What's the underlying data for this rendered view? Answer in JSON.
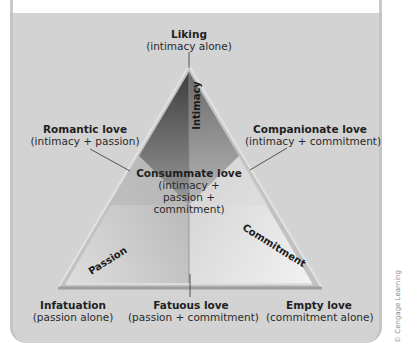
{
  "diagram": {
    "sides": {
      "intimacy": "Intimacy",
      "passion": "Passion",
      "commitment": "Commitment"
    },
    "nodes": [
      {
        "id": "liking",
        "name": "Liking",
        "desc": "(intimacy alone)"
      },
      {
        "id": "romantic",
        "name": "Romantic love",
        "desc": "(intimacy + passion)"
      },
      {
        "id": "companionate",
        "name": "Companionate love",
        "desc": "(intimacy + commitment)"
      },
      {
        "id": "consummate",
        "name": "Consummate love",
        "desc": "(intimacy +",
        "desc2": "passion +",
        "desc3": "commitment)"
      },
      {
        "id": "infatuation",
        "name": "Infatuation",
        "desc": "(passion alone)"
      },
      {
        "id": "fatuous",
        "name": "Fatuous love",
        "desc": "(passion + commitment)"
      },
      {
        "id": "empty",
        "name": "Empty love",
        "desc": "(commitment alone)"
      }
    ],
    "credit": "© Cengage Learning"
  },
  "colors": {
    "panel_bg": "#d3d3d3",
    "triangle_edge": "#c8c8c8",
    "dark_shade": "#555555",
    "text": "#1f1f1f"
  }
}
